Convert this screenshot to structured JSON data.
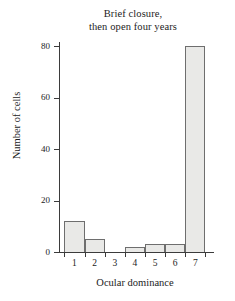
{
  "chart_data": {
    "type": "bar",
    "title": "Brief closure, then open four years",
    "title_lines": [
      "Brief closure,",
      "then open four years"
    ],
    "categories": [
      "1",
      "2",
      "3",
      "4",
      "5",
      "6",
      "7"
    ],
    "values": [
      12,
      5,
      0,
      2,
      3,
      3,
      80
    ],
    "xlabel": "Ocular dominance",
    "ylabel": "Number of cells",
    "ylim": [
      0,
      80
    ],
    "yticks": [
      0,
      20,
      40,
      60,
      80
    ],
    "ytick_labels": [
      "0",
      "20",
      "40",
      "60",
      "80"
    ],
    "grid": false,
    "legend": false,
    "bar_fill_color": "#e9e9e7",
    "bar_edge_color": "#6e6e6e",
    "axis_color": "#3b3b3b",
    "background_color": "#ffffff"
  }
}
